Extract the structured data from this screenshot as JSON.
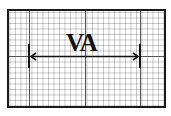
{
  "diagram": {
    "label": "VA",
    "grid": {
      "minor_spacing_px": 5.5,
      "major_every": 10
    },
    "measurement": {
      "start_x": 29,
      "end_x": 140,
      "y": 56
    }
  }
}
